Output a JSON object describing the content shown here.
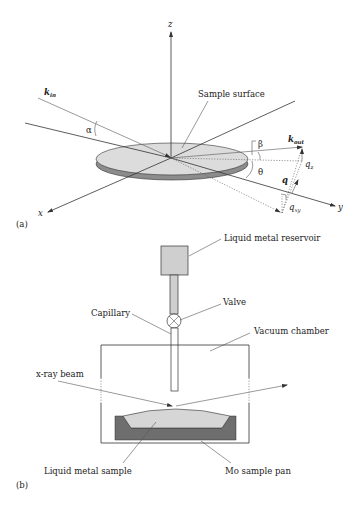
{
  "panel_a": {
    "label": "(a)",
    "axes": {
      "x": "x",
      "y": "y",
      "z": "z"
    },
    "k_in": {
      "main": "k",
      "sub": "in"
    },
    "k_out": {
      "main": "k",
      "sub": "out"
    },
    "alpha": "α",
    "beta": "β",
    "theta": "θ",
    "q": "q",
    "q_z": {
      "main": "q",
      "sub": "z"
    },
    "q_xy": {
      "main": "q",
      "sub": "xy"
    },
    "sample_surface": "Sample surface"
  },
  "panel_b": {
    "label": "(b)",
    "reservoir": "Liquid metal reservoir",
    "valve": "Valve",
    "capillary": "Capillary",
    "vacuum_chamber": "Vacuum chamber",
    "xray_beam": "x-ray beam",
    "liquid_metal_sample": "Liquid metal sample",
    "sample_pan": "Mo sample pan"
  },
  "colors": {
    "disk_top": "#dcdcdc",
    "disk_side": "#8c8c8c",
    "pan": "#6e6e6e",
    "sample": "#d6d6d6",
    "reservoir": "#cfcfcf"
  }
}
